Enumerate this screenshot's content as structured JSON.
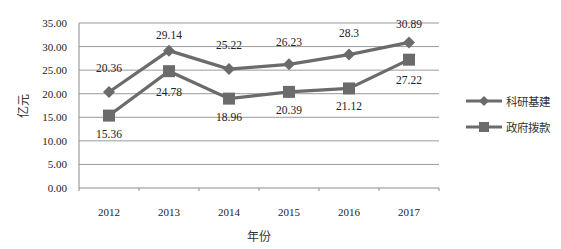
{
  "chart_data": {
    "type": "line",
    "title": "",
    "xlabel": "年份",
    "ylabel": "亿元",
    "categories": [
      "2012",
      "2013",
      "2014",
      "2015",
      "2016",
      "2017"
    ],
    "series": [
      {
        "name": "科研基建",
        "marker": "diamond",
        "values": [
          20.36,
          29.14,
          25.22,
          26.23,
          28.3,
          30.89
        ],
        "labels": [
          "20.36",
          "29.14",
          "25.22",
          "26.23",
          "28.3",
          "30.89"
        ],
        "label_position": "above"
      },
      {
        "name": "政府拨款",
        "marker": "square",
        "values": [
          15.36,
          24.78,
          18.96,
          20.39,
          21.12,
          27.22
        ],
        "labels": [
          "15.36",
          "24.78",
          "18.96",
          "20.39",
          "21.12",
          "27.22"
        ],
        "label_position": "below"
      }
    ],
    "ylim": [
      0,
      35
    ],
    "yticks": [
      "0.00",
      "5.00",
      "10.00",
      "15.00",
      "20.00",
      "25.00",
      "30.00",
      "35.00"
    ],
    "grid": true,
    "legend_position": "right"
  },
  "colors": {
    "series": "#6b6b6b",
    "grid": "#9a9a9a",
    "axis": "#8c8c8c"
  },
  "legend": {
    "items": [
      {
        "label": "科研基建",
        "marker": "diamond"
      },
      {
        "label": "政府拨款",
        "marker": "square"
      }
    ]
  }
}
